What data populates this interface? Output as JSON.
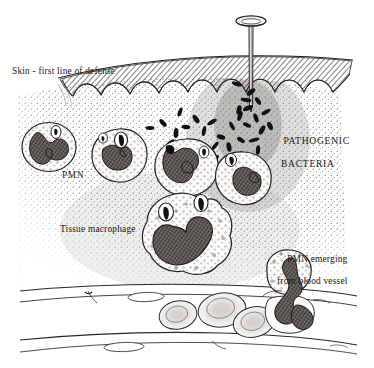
{
  "figure": {
    "domain": "biology-illustration",
    "width": 374,
    "height": 368,
    "background_color": "#ffffff",
    "ink_color": "#1c1a18"
  },
  "labels": {
    "skin": "Skin - first line of defense",
    "pmn": "PMN",
    "macrophage": "Tissue macrophage",
    "bacteria_line1": "PATHOGENIC",
    "bacteria_line2": "BACTERIA",
    "emerging_line1": "PMN emerging",
    "emerging_line2": "from blood vessel"
  },
  "structures": {
    "nail": {
      "name": "nail",
      "head_center_x": 251,
      "head_center_y": 21,
      "head_rx": 15,
      "head_ry": 5,
      "shaft_top_y": 24,
      "shaft_tip_y": 112,
      "shaft_width": 4
    },
    "skin_band": {
      "name": "skin-epidermis",
      "top_y": 57,
      "bottom_y": 92,
      "hatch_color": "#3a3733",
      "scallop_count": 9
    },
    "tissue": {
      "name": "connective-tissue",
      "top_y": 80,
      "bottom_y": 285,
      "stipple_color": "#6d6a66"
    },
    "blood_vessel": {
      "name": "blood-vessel",
      "top_wall_y": 288,
      "bottom_wall_y": 346,
      "lumen_color": "#ffffff"
    }
  },
  "cells": {
    "pmn_list": [
      {
        "id": "pmn-1",
        "label": "PMN",
        "cx": 49,
        "cy": 147,
        "rx": 27,
        "ry": 24,
        "state": "resting"
      },
      {
        "id": "pmn-2",
        "label": "PMN",
        "cx": 119,
        "cy": 156,
        "rx": 28,
        "ry": 26,
        "state": "phagocytosing"
      },
      {
        "id": "pmn-3",
        "label": "PMN",
        "cx": 186,
        "cy": 168,
        "rx": 33,
        "ry": 29,
        "state": "migrating"
      },
      {
        "id": "pmn-4",
        "label": "PMN",
        "cx": 243,
        "cy": 178,
        "rx": 29,
        "ry": 27,
        "state": "migrating"
      },
      {
        "id": "pmn-5",
        "label": "PMN emerging from blood vessel",
        "cx": 288,
        "cy": 272,
        "rx": 23,
        "ry": 22,
        "state": "diapedesis"
      }
    ],
    "macrophage": {
      "id": "macrophage-1",
      "label": "Tissue macrophage",
      "cx": 188,
      "cy": 235,
      "rx": 43,
      "ry": 39,
      "vacuole_count": 2
    },
    "erythrocytes": [
      {
        "id": "rbc-1",
        "cx": 178,
        "cy": 315,
        "rx": 19,
        "ry": 14,
        "rot": -12
      },
      {
        "id": "rbc-2",
        "cx": 222,
        "cy": 310,
        "rx": 24,
        "ry": 17,
        "rot": -10
      },
      {
        "id": "rbc-3",
        "cx": 253,
        "cy": 321,
        "rx": 21,
        "ry": 15,
        "rot": -14
      }
    ]
  },
  "bacteria": {
    "name": "pathogenic-bacteria",
    "shape": "rod",
    "color": "#121110",
    "count": 34,
    "points": [
      [
        150,
        128
      ],
      [
        163,
        123
      ],
      [
        176,
        133
      ],
      [
        170,
        143
      ],
      [
        186,
        127
      ],
      [
        196,
        119
      ],
      [
        204,
        131
      ],
      [
        212,
        122
      ],
      [
        221,
        137
      ],
      [
        232,
        126
      ],
      [
        240,
        116
      ],
      [
        248,
        108
      ],
      [
        247,
        125
      ],
      [
        256,
        118
      ],
      [
        262,
        130
      ],
      [
        254,
        140
      ],
      [
        241,
        140
      ],
      [
        229,
        147
      ],
      [
        215,
        146
      ],
      [
        200,
        145
      ],
      [
        188,
        148
      ],
      [
        201,
        158
      ],
      [
        215,
        159
      ],
      [
        229,
        160
      ],
      [
        243,
        155
      ],
      [
        258,
        150
      ],
      [
        251,
        92
      ],
      [
        246,
        100
      ],
      [
        258,
        101
      ],
      [
        239,
        110
      ],
      [
        266,
        112
      ],
      [
        237,
        84
      ],
      [
        270,
        126
      ],
      [
        180,
        112
      ]
    ]
  }
}
